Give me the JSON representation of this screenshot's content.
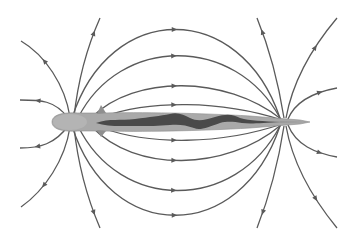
{
  "diagram": {
    "title": "",
    "colors": {
      "background": "#ffffff",
      "field_line": "#5a5a5a",
      "fish_body": "#a9a9a9",
      "electric_organ": "#4a4a4a"
    },
    "poles": {
      "head": {
        "x": 70,
        "y": 122
      },
      "tail": {
        "x": 283,
        "y": 122
      }
    },
    "field_lines": {
      "top_arcs": [
        {
          "id": "top-1",
          "path": "M72,118 C110,0 240,0 280,118",
          "arrow": [
            174,
            19
          ]
        },
        {
          "id": "top-2",
          "path": "M78,118 C120,35 235,35 280,118",
          "arrow": [
            174,
            52
          ]
        },
        {
          "id": "top-3",
          "path": "M92,117 C135,75 225,75 281,119",
          "arrow": [
            174,
            85
          ]
        },
        {
          "id": "top-4",
          "path": "M102,117 C150,100 220,100 282,120",
          "arrow": [
            174,
            104
          ]
        }
      ],
      "bottom_arcs": [
        {
          "id": "bot-1",
          "path": "M72,126 C110,245 240,245 280,126",
          "arrow": [
            174,
            228
          ]
        },
        {
          "id": "bot-2",
          "path": "M78,126 C120,212 235,212 280,126",
          "arrow": [
            174,
            195
          ]
        },
        {
          "id": "bot-3",
          "path": "M92,127 C135,172 225,172 281,125",
          "arrow": [
            174,
            162
          ]
        },
        {
          "id": "bot-4",
          "path": "M102,128 C150,145 220,145 282,124",
          "arrow": [
            174,
            142
          ]
        }
      ],
      "head_outer": [
        {
          "id": "head-up-1",
          "path": "M68,118 C55,100 40,100 20,100",
          "arrow": [
            38,
            100
          ]
        },
        {
          "id": "head-up-2",
          "path": "M70,117 C65,85 45,55 21,41",
          "arrow": [
            46,
            60
          ]
        },
        {
          "id": "head-up-3",
          "path": "M74,117 C78,80 88,45 100,18",
          "arrow": [
            93,
            33
          ]
        },
        {
          "id": "head-down-1",
          "path": "M68,126 C55,144 40,148 20,148",
          "arrow": [
            38,
            148
          ]
        },
        {
          "id": "head-down-2",
          "path": "M70,127 C65,160 45,190 21,207",
          "arrow": [
            46,
            187
          ]
        },
        {
          "id": "head-down-3",
          "path": "M74,127 C78,165 88,200 100,228",
          "arrow": [
            93,
            213
          ]
        }
      ],
      "tail_outer": [
        {
          "id": "tail-up-1",
          "path": "M284,118 C278,80 268,45 257,18",
          "arrow": [
            262,
            32
          ]
        },
        {
          "id": "tail-up-2",
          "path": "M286,118 C292,85 310,50 337,18",
          "arrow": [
            313,
            46
          ]
        },
        {
          "id": "tail-up-3",
          "path": "M288,119 C296,100 315,92 337,88",
          "arrow": [
            320,
            93
          ]
        },
        {
          "id": "tail-down-1",
          "path": "M284,126 C278,165 268,200 257,228",
          "arrow": [
            262,
            212
          ]
        },
        {
          "id": "tail-down-2",
          "path": "M286,126 C292,160 310,195 337,228",
          "arrow": [
            313,
            200
          ]
        },
        {
          "id": "tail-down-3",
          "path": "M288,125 C296,145 315,153 337,157",
          "arrow": [
            320,
            151
          ]
        }
      ]
    }
  }
}
